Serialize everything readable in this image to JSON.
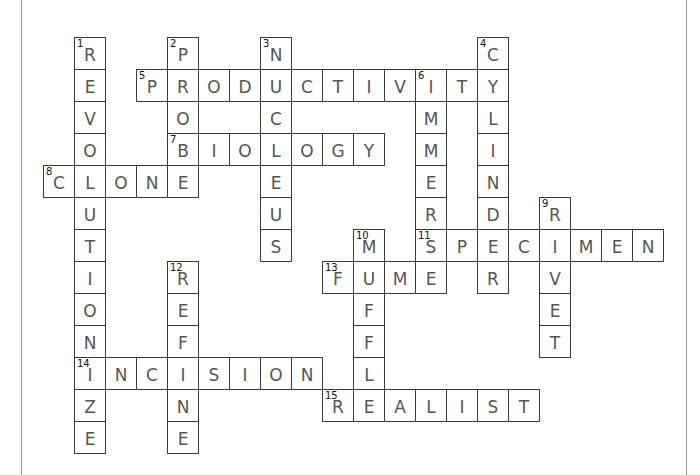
{
  "puzzle": {
    "grid_origin": {
      "x": 43,
      "y": 37
    },
    "cell_pitch": {
      "x": 31,
      "y": 32
    },
    "colors": {
      "border": "#3a3a3a",
      "letter": "#555555",
      "number": "#111111",
      "frame": "#9a9a9a"
    },
    "entries": [
      {
        "number": "1",
        "answer": "REVOLUTIONIZE",
        "direction": "down",
        "row": 0,
        "col": 1
      },
      {
        "number": "2",
        "answer": "PROBE",
        "direction": "down",
        "row": 0,
        "col": 4
      },
      {
        "number": "3",
        "answer": "NUCLEUS",
        "direction": "down",
        "row": 0,
        "col": 7
      },
      {
        "number": "4",
        "answer": "CYLINDER",
        "direction": "down",
        "row": 0,
        "col": 14
      },
      {
        "number": "5",
        "answer": "PRODUCTIVITY",
        "direction": "across",
        "row": 1,
        "col": 3
      },
      {
        "number": "6",
        "answer": "IMMERSE",
        "direction": "down",
        "row": 1,
        "col": 12
      },
      {
        "number": "7",
        "answer": "BIOLOGY",
        "direction": "across",
        "row": 3,
        "col": 4
      },
      {
        "number": "8",
        "answer": "CLONE",
        "direction": "across",
        "row": 4,
        "col": 0
      },
      {
        "number": "9",
        "answer": "RIVET",
        "direction": "down",
        "row": 5,
        "col": 16
      },
      {
        "number": "10",
        "answer": "MUFFLE",
        "direction": "down",
        "row": 6,
        "col": 10
      },
      {
        "number": "11",
        "answer": "SPECIMEN",
        "direction": "across",
        "row": 6,
        "col": 12
      },
      {
        "number": "12",
        "answer": "REFINE",
        "direction": "down",
        "row": 7,
        "col": 4
      },
      {
        "number": "13",
        "answer": "FUME",
        "direction": "across",
        "row": 7,
        "col": 9
      },
      {
        "number": "14",
        "answer": "INCISION",
        "direction": "across",
        "row": 10,
        "col": 1
      },
      {
        "number": "15",
        "answer": "REALIST",
        "direction": "across",
        "row": 11,
        "col": 9
      }
    ]
  }
}
